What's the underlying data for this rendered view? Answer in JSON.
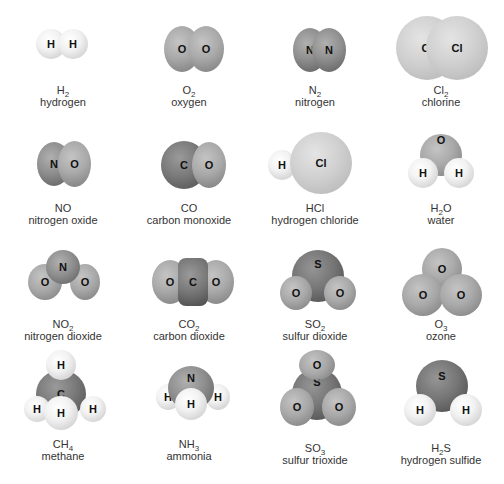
{
  "molecules": [
    {
      "formula": "H",
      "sub": "2",
      "after": "",
      "name": "hydrogen",
      "atoms": [
        "H",
        "H"
      ]
    },
    {
      "formula": "O",
      "sub": "2",
      "after": "",
      "name": "oxygen",
      "atoms": [
        "O",
        "O"
      ]
    },
    {
      "formula": "N",
      "sub": "2",
      "after": "",
      "name": "nitrogen",
      "atoms": [
        "N",
        "N"
      ]
    },
    {
      "formula": "Cl",
      "sub": "2",
      "after": "",
      "name": "chlorine",
      "atoms": [
        "Cl",
        "Cl"
      ]
    },
    {
      "formula": "NO",
      "sub": "",
      "after": "",
      "name": "nitrogen oxide",
      "atoms": [
        "N",
        "O"
      ]
    },
    {
      "formula": "CO",
      "sub": "",
      "after": "",
      "name": "carbon monoxide",
      "atoms": [
        "C",
        "O"
      ]
    },
    {
      "formula": "HCl",
      "sub": "",
      "after": "",
      "name": "hydrogen chloride",
      "atoms": [
        "H",
        "Cl"
      ]
    },
    {
      "formula": "H",
      "sub": "2",
      "after": "O",
      "name": "water",
      "atoms": [
        "O",
        "H",
        "H"
      ]
    },
    {
      "formula": "NO",
      "sub": "2",
      "after": "",
      "name": "nitrogen dioxide",
      "atoms": [
        "N",
        "O",
        "O"
      ]
    },
    {
      "formula": "CO",
      "sub": "2",
      "after": "",
      "name": "carbon dioxide",
      "atoms": [
        "O",
        "C",
        "O"
      ]
    },
    {
      "formula": "SO",
      "sub": "2",
      "after": "",
      "name": "sulfur dioxide",
      "atoms": [
        "S",
        "O",
        "O"
      ]
    },
    {
      "formula": "O",
      "sub": "3",
      "after": "",
      "name": "ozone",
      "atoms": [
        "O",
        "O",
        "O"
      ]
    },
    {
      "formula": "CH",
      "sub": "4",
      "after": "",
      "name": "methane",
      "atoms": [
        "H",
        "C",
        "H",
        "H",
        "H"
      ]
    },
    {
      "formula": "NH",
      "sub": "3",
      "after": "",
      "name": "ammonia",
      "atoms": [
        "N",
        "H",
        "H",
        "H"
      ]
    },
    {
      "formula": "SO",
      "sub": "3",
      "after": "",
      "name": "sulfur trioxide",
      "atoms": [
        "O",
        "S",
        "O",
        "O"
      ]
    },
    {
      "formula": "H",
      "sub": "2",
      "after": "S",
      "name": "hydrogen sulfide",
      "atoms": [
        "S",
        "H",
        "H"
      ]
    }
  ]
}
